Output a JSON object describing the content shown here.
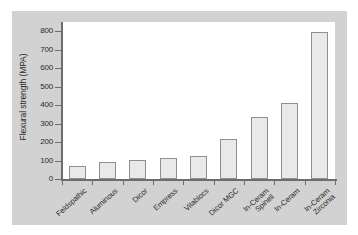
{
  "chart_data": {
    "type": "bar",
    "title": "",
    "xlabel": "",
    "ylabel": "Flexural strength (MPA)",
    "ylim": [
      0,
      850
    ],
    "yticks": [
      0,
      100,
      200,
      300,
      400,
      500,
      600,
      700,
      800
    ],
    "ytick_labels": [
      "0",
      "100",
      "200",
      "300",
      "400",
      "500",
      "600",
      "700",
      "800"
    ],
    "grid": false,
    "legend": null,
    "categories": [
      "Feldspathic",
      "Aluminous",
      "Dicor",
      "Empress",
      "Vitablocs",
      "Dicor MGC",
      "In-Ceram Spinell",
      "In-Ceram",
      "In-Ceram Zirconia"
    ],
    "category_lines": [
      [
        "Feldspathic"
      ],
      [
        "Aluminous"
      ],
      [
        "Dicor"
      ],
      [
        "Empress"
      ],
      [
        "Vitablocs"
      ],
      [
        "Dicor MGC"
      ],
      [
        "In-Ceram",
        "Spinell"
      ],
      [
        "In-Ceram"
      ],
      [
        "In-Ceram",
        "Zirconia"
      ]
    ],
    "values": [
      70,
      93,
      103,
      115,
      127,
      214,
      335,
      412,
      797
    ],
    "units": "MPa",
    "colors": {
      "bar_fill": "#e9e9e9",
      "bar_edge": "#8f8f8f",
      "axis": "#6d6d6d",
      "text": "#2a2a2a",
      "panel_background": "#d2d2d2",
      "plot_background": "#ffffff"
    }
  }
}
